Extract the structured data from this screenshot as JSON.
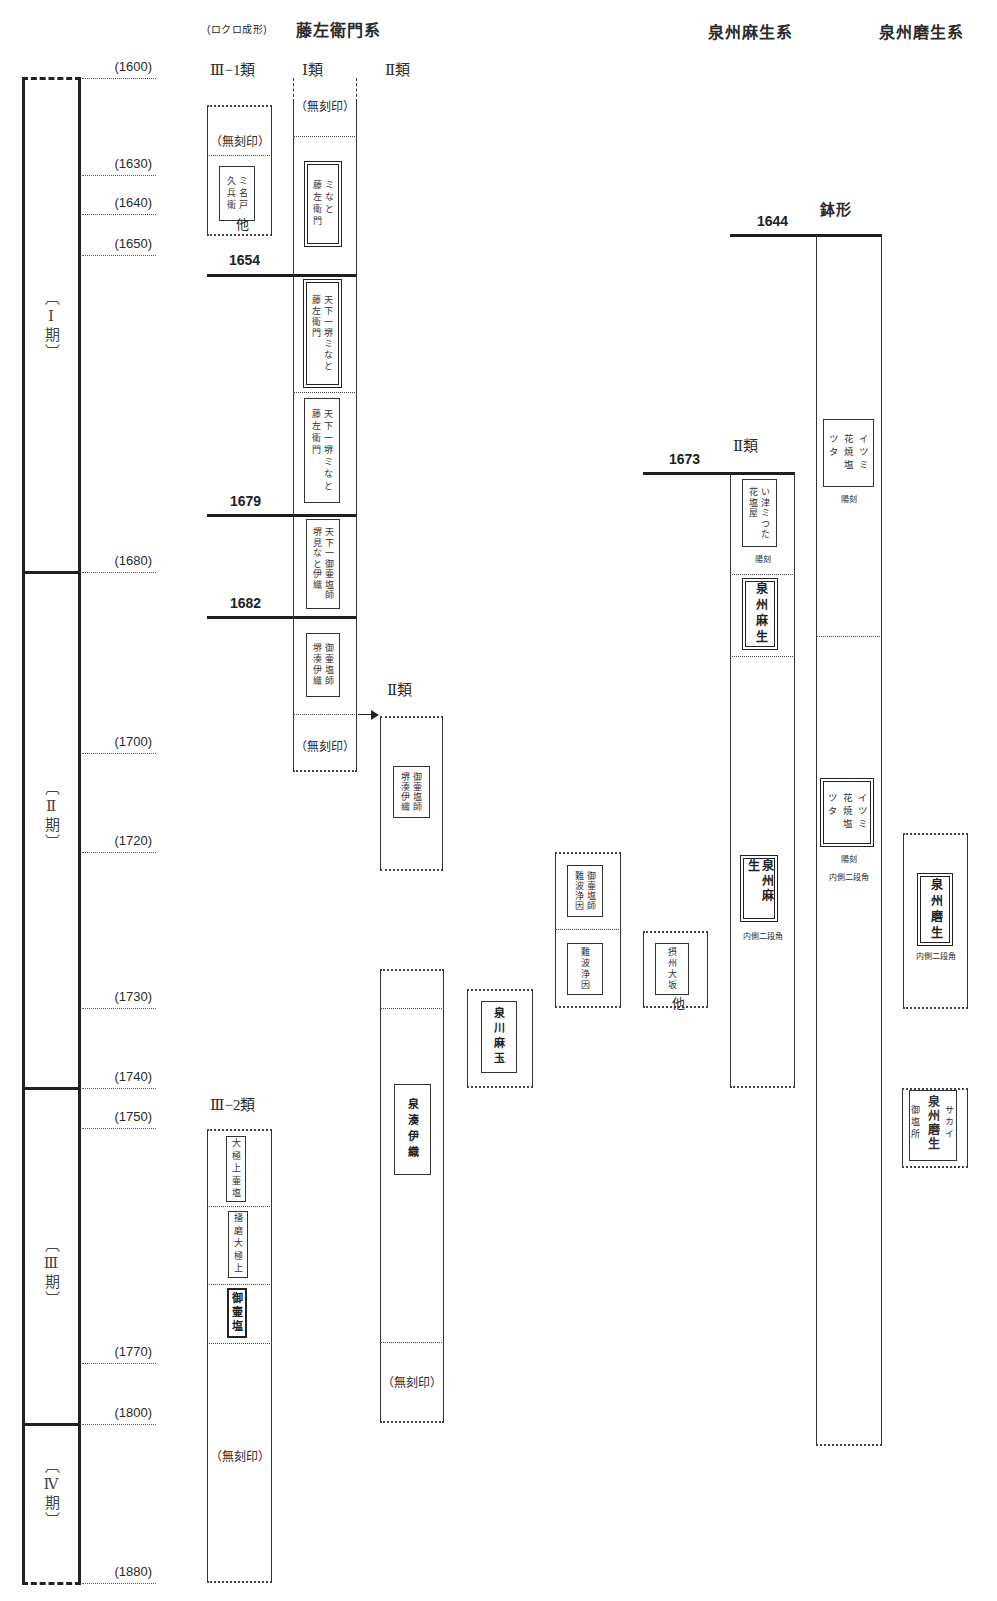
{
  "header": {
    "technique_note": "(ロクロ成形)",
    "series_fujizaemon": "藤左衛門系",
    "series_izumi_aso": "泉州麻生系",
    "series_izumi_maso": "泉州磨生系"
  },
  "year_axis": [
    "(1600)",
    "(1630)",
    "(1640)",
    "(1650)",
    "(1680)",
    "(1700)",
    "(1720)",
    "(1730)",
    "(1740)",
    "(1750)",
    "(1770)",
    "(1800)",
    "(1880)"
  ],
  "periods": [
    "〔Ⅰ期〕",
    "〔Ⅱ期〕",
    "〔Ⅲ期〕",
    "〔Ⅳ期〕"
  ],
  "date_markers": {
    "y1654": "1654",
    "y1679": "1679",
    "y1682": "1682",
    "y1644": "1644",
    "y1673": "1673"
  },
  "columns": {
    "fuji_iii_1": {
      "label": "Ⅲ−1類",
      "segments": [
        {
          "text": "（無刻印）"
        },
        {
          "stamp": "ミ名戸\n久兵衛",
          "border": "single",
          "note": "他"
        }
      ]
    },
    "fuji_i": {
      "label": "Ⅰ類",
      "segments": [
        {
          "text": "（無刻印）"
        },
        {
          "stamp": "ミなと\n藤左衛門",
          "border": "double"
        },
        {
          "stamp": "天下一堺ミなと\n藤左衛門",
          "border": "double"
        },
        {
          "stamp": "天下一堺ミなと\n藤左衛門",
          "border": "single"
        },
        {
          "stamp": "天下一御壷塩師\n堺見なと伊織",
          "border": "single"
        },
        {
          "stamp": "御壷塩師\n堺湊伊織",
          "border": "single"
        },
        {
          "text": "（無刻印）"
        }
      ]
    },
    "fuji_ii": {
      "label": "Ⅱ類",
      "segments": [
        {
          "stamp": "御壷塩師\n堺湊伊織",
          "border": "single"
        }
      ]
    },
    "fuji_ii_late": {
      "segments": [
        {
          "stamp": "泉湊伊織",
          "border": "single"
        },
        {
          "text": "（無刻印）"
        }
      ]
    },
    "senkawa": {
      "segments": [
        {
          "stamp": "泉川麻玉",
          "border": "single"
        }
      ]
    },
    "nanba": {
      "segments": [
        {
          "stamp": "御壷塩師\n難波浄因",
          "border": "single"
        },
        {
          "stamp": "難波浄因",
          "border": "single"
        }
      ]
    },
    "sesshu": {
      "segments": [
        {
          "stamp": "摂州大坂",
          "border": "single",
          "note": "他"
        }
      ]
    },
    "aso_ii": {
      "label": "Ⅱ類",
      "segments": [
        {
          "stamp": "い津ミつた\n花塩屋",
          "border": "single",
          "note": "陽刻"
        },
        {
          "stamp": "泉州麻生",
          "border": "double"
        },
        {
          "stamp": "泉州麻生",
          "border": "double",
          "note": "内側二段角"
        }
      ]
    },
    "aso_hachi": {
      "label": "鉢形",
      "segments": [
        {
          "stamp": "イツミ\n花焼塩\nツタ",
          "border": "single",
          "note": "陽刻"
        },
        {
          "stamp": "イツミ\n花焼塩\nツタ",
          "border": "double",
          "note": "陽刻",
          "note2": "内側二段角"
        }
      ]
    },
    "maso": {
      "segments": [
        {
          "stamp": "泉州磨生",
          "border": "double",
          "note": "内側二段角"
        }
      ]
    },
    "maso_late": {
      "segments": [
        {
          "stamp_right": "サカイ",
          "stamp_main": "泉州磨生",
          "stamp_left": "御塩所",
          "border": "single"
        }
      ]
    },
    "fuji_iii_2": {
      "label": "Ⅲ−2類",
      "segments": [
        {
          "stamp": "大極上壷塩",
          "border": "single"
        },
        {
          "stamp": "播磨大極上",
          "border": "single"
        },
        {
          "stamp": "御壷塩",
          "border": "bold"
        },
        {
          "text": "（無刻印）"
        }
      ]
    }
  }
}
